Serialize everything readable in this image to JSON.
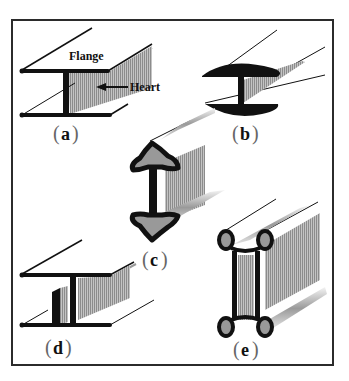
{
  "figure": {
    "frame_color": "#2b2b2b",
    "ink_color": "#111111",
    "shade_color": "#b8b8b8",
    "panels": [
      {
        "id": "a",
        "label": "a",
        "annotations": [
          "Flange",
          "Heart"
        ]
      },
      {
        "id": "b",
        "label": "b"
      },
      {
        "id": "c",
        "label": "c"
      },
      {
        "id": "d",
        "label": "d"
      },
      {
        "id": "e",
        "label": "e"
      }
    ]
  }
}
